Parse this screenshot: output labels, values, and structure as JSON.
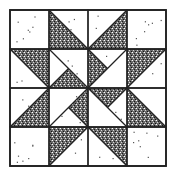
{
  "figure": {
    "grid": {
      "rows": 4,
      "cols": 4
    },
    "colors": {
      "background": "#ffffff",
      "line": "#222222",
      "stipple": "#333333",
      "light_fabric": "#ffffff"
    }
  },
  "cells": [
    {
      "col": 0,
      "row": 0,
      "type": "plain"
    },
    {
      "col": 1,
      "row": 0,
      "type": "hst",
      "dark": "bottom-left"
    },
    {
      "col": 2,
      "row": 0,
      "type": "hst",
      "dark": "bottom-right"
    },
    {
      "col": 3,
      "row": 0,
      "type": "plain"
    },
    {
      "col": 0,
      "row": 1,
      "type": "hst",
      "dark": "top-right"
    },
    {
      "col": 1,
      "row": 1,
      "type": "qst",
      "dark": "bottom"
    },
    {
      "col": 2,
      "row": 1,
      "type": "qst",
      "dark": "left"
    },
    {
      "col": 3,
      "row": 1,
      "type": "hst",
      "dark": "top-left"
    },
    {
      "col": 0,
      "row": 2,
      "type": "hst",
      "dark": "bottom-right"
    },
    {
      "col": 1,
      "row": 2,
      "type": "qst",
      "dark": "right"
    },
    {
      "col": 2,
      "row": 2,
      "type": "qst",
      "dark": "top"
    },
    {
      "col": 3,
      "row": 2,
      "type": "hst",
      "dark": "bottom-left"
    },
    {
      "col": 0,
      "row": 3,
      "type": "plain"
    },
    {
      "col": 1,
      "row": 3,
      "type": "hst",
      "dark": "top-left"
    },
    {
      "col": 2,
      "row": 3,
      "type": "hst",
      "dark": "top-right"
    },
    {
      "col": 3,
      "row": 3,
      "type": "plain"
    }
  ]
}
